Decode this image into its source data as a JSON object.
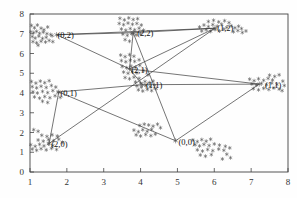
{
  "chart_data": {
    "type": "scatter",
    "title": "",
    "xlabel": "",
    "ylabel": "",
    "xlim": [
      1,
      8
    ],
    "ylim": [
      0,
      8
    ],
    "xticks": [
      1,
      2,
      3,
      4,
      5,
      6,
      7,
      8
    ],
    "yticks": [
      0,
      1,
      2,
      3,
      4,
      5,
      6,
      7,
      8
    ],
    "grid": false,
    "legend": "none",
    "marker": "asterisk",
    "marker_color": "#555555",
    "edge_color": "#3a3a3a",
    "axis_color": "#444444",
    "node_labels": [
      {
        "text": "(0,2)",
        "x": 1.72,
        "y": 6.95
      },
      {
        "text": "(2,2)",
        "x": 3.88,
        "y": 7.05
      },
      {
        "text": "(1,2)",
        "x": 6.05,
        "y": 7.32
      },
      {
        "text": "(2,1)",
        "x": 3.72,
        "y": 5.18
      },
      {
        "text": "(1,1)",
        "x": 4.12,
        "y": 4.42
      },
      {
        "text": "(0,1)",
        "x": 1.8,
        "y": 4.02
      },
      {
        "text": "(1,1)",
        "x": 7.35,
        "y": 4.42
      },
      {
        "text": "(2,0)",
        "x": 1.55,
        "y": 1.42
      },
      {
        "text": "(0,0)",
        "x": 5.0,
        "y": 1.55
      }
    ],
    "nodes": [
      {
        "id": "n02",
        "x": 1.72,
        "y": 6.95
      },
      {
        "id": "n22",
        "x": 3.8,
        "y": 7.05
      },
      {
        "id": "n12",
        "x": 6.02,
        "y": 7.28
      },
      {
        "id": "n21",
        "x": 3.7,
        "y": 5.22
      },
      {
        "id": "n11c",
        "x": 4.05,
        "y": 4.42
      },
      {
        "id": "n01",
        "x": 1.78,
        "y": 4.05
      },
      {
        "id": "n11r",
        "x": 7.22,
        "y": 4.45
      },
      {
        "id": "n20",
        "x": 1.52,
        "y": 1.45
      },
      {
        "id": "n00",
        "x": 4.95,
        "y": 1.58
      }
    ],
    "edges": [
      {
        "from": "n02",
        "to": "n22"
      },
      {
        "from": "n02",
        "to": "n12"
      },
      {
        "from": "n22",
        "to": "n12"
      },
      {
        "from": "n02",
        "to": "n21"
      },
      {
        "from": "n22",
        "to": "n21"
      },
      {
        "from": "n22",
        "to": "n00"
      },
      {
        "from": "n12",
        "to": "n21"
      },
      {
        "from": "n12",
        "to": "n20"
      },
      {
        "from": "n21",
        "to": "n11c"
      },
      {
        "from": "n21",
        "to": "n11r"
      },
      {
        "from": "n01",
        "to": "n11c"
      },
      {
        "from": "n11c",
        "to": "n11r"
      },
      {
        "from": "n01",
        "to": "n20"
      },
      {
        "from": "n01",
        "to": "n00"
      },
      {
        "from": "n00",
        "to": "n11r"
      }
    ],
    "clusters": [
      {
        "label": "(0,2)",
        "cx": 1.32,
        "cy": 6.92,
        "n": 26,
        "sx": 0.22,
        "sy": 0.34
      },
      {
        "label": "(2,2)",
        "cx": 3.72,
        "cy": 7.22,
        "n": 22,
        "sx": 0.26,
        "sy": 0.3
      },
      {
        "label": "(1,2)",
        "cx": 6.05,
        "cy": 7.28,
        "n": 26,
        "sx": 0.34,
        "sy": 0.24
      },
      {
        "label": "(2,1)",
        "cx": 3.68,
        "cy": 5.35,
        "n": 24,
        "sx": 0.26,
        "sy": 0.52
      },
      {
        "label": "(1,1)",
        "cx": 4.05,
        "cy": 4.42,
        "n": 16,
        "sx": 0.24,
        "sy": 0.22
      },
      {
        "label": "(0,1)",
        "cx": 1.52,
        "cy": 4.08,
        "n": 24,
        "sx": 0.28,
        "sy": 0.33
      },
      {
        "label": "(1,1)r",
        "cx": 7.32,
        "cy": 4.45,
        "n": 24,
        "sx": 0.3,
        "sy": 0.26
      },
      {
        "label": "(2,0)",
        "cx": 1.4,
        "cy": 1.38,
        "n": 24,
        "sx": 0.28,
        "sy": 0.26
      },
      {
        "label": "(0,0)",
        "cx": 5.85,
        "cy": 1.3,
        "n": 22,
        "sx": 0.38,
        "sy": 0.4
      },
      {
        "label": "mid",
        "cx": 4.15,
        "cy": 2.2,
        "n": 16,
        "sx": 0.3,
        "sy": 0.28
      }
    ],
    "points": [
      [
        1.04,
        7.42
      ],
      [
        1.12,
        7.3
      ],
      [
        1.2,
        7.44
      ],
      [
        1.3,
        7.28
      ],
      [
        1.38,
        7.2
      ],
      [
        1.48,
        7.34
      ],
      [
        1.02,
        7.1
      ],
      [
        1.1,
        7.06
      ],
      [
        1.18,
        7.12
      ],
      [
        1.26,
        7.02
      ],
      [
        1.36,
        7.08
      ],
      [
        1.46,
        7.0
      ],
      [
        1.06,
        6.86
      ],
      [
        1.14,
        6.78
      ],
      [
        1.24,
        6.88
      ],
      [
        1.34,
        6.76
      ],
      [
        1.44,
        6.82
      ],
      [
        1.56,
        6.96
      ],
      [
        1.08,
        6.6
      ],
      [
        1.18,
        6.54
      ],
      [
        1.3,
        6.62
      ],
      [
        1.42,
        6.58
      ],
      [
        1.52,
        6.66
      ],
      [
        1.62,
        6.6
      ],
      [
        1.22,
        6.42
      ],
      [
        1.6,
        6.9
      ],
      [
        3.44,
        7.78
      ],
      [
        3.56,
        7.7
      ],
      [
        3.68,
        7.8
      ],
      [
        3.8,
        7.72
      ],
      [
        3.92,
        7.76
      ],
      [
        3.42,
        7.52
      ],
      [
        3.54,
        7.46
      ],
      [
        3.66,
        7.54
      ],
      [
        3.78,
        7.48
      ],
      [
        3.9,
        7.52
      ],
      [
        4.02,
        7.44
      ],
      [
        3.48,
        7.24
      ],
      [
        3.6,
        7.18
      ],
      [
        3.72,
        7.26
      ],
      [
        3.84,
        7.2
      ],
      [
        3.96,
        7.28
      ],
      [
        4.08,
        7.18
      ],
      [
        3.52,
        6.98
      ],
      [
        3.64,
        6.92
      ],
      [
        3.76,
        7.0
      ],
      [
        3.88,
        6.94
      ],
      [
        4.0,
        6.98
      ],
      [
        3.58,
        6.7
      ],
      [
        3.7,
        6.62
      ],
      [
        5.6,
        7.34
      ],
      [
        5.72,
        7.44
      ],
      [
        5.84,
        7.36
      ],
      [
        5.96,
        7.46
      ],
      [
        6.08,
        7.38
      ],
      [
        6.2,
        7.48
      ],
      [
        5.66,
        7.14
      ],
      [
        5.78,
        7.2
      ],
      [
        5.9,
        7.12
      ],
      [
        6.02,
        7.22
      ],
      [
        6.14,
        7.14
      ],
      [
        6.26,
        7.24
      ],
      [
        5.84,
        7.62
      ],
      [
        5.98,
        7.68
      ],
      [
        6.12,
        7.6
      ],
      [
        6.28,
        7.66
      ],
      [
        6.4,
        7.56
      ],
      [
        6.34,
        7.32
      ],
      [
        6.46,
        7.4
      ],
      [
        6.56,
        7.3
      ],
      [
        6.66,
        7.38
      ],
      [
        6.74,
        7.26
      ],
      [
        6.52,
        7.1
      ],
      [
        6.64,
        7.16
      ],
      [
        6.76,
        7.06
      ],
      [
        6.86,
        7.14
      ],
      [
        3.46,
        5.92
      ],
      [
        3.58,
        5.84
      ],
      [
        3.7,
        5.94
      ],
      [
        3.82,
        5.86
      ],
      [
        3.48,
        5.64
      ],
      [
        3.6,
        5.58
      ],
      [
        3.72,
        5.66
      ],
      [
        3.84,
        5.6
      ],
      [
        3.96,
        5.68
      ],
      [
        3.5,
        5.34
      ],
      [
        3.62,
        5.28
      ],
      [
        3.74,
        5.36
      ],
      [
        3.86,
        5.3
      ],
      [
        3.98,
        5.4
      ],
      [
        3.54,
        5.06
      ],
      [
        3.66,
        5.0
      ],
      [
        3.78,
        5.08
      ],
      [
        3.9,
        5.02
      ],
      [
        4.08,
        5.14
      ],
      [
        3.58,
        4.78
      ],
      [
        3.7,
        4.72
      ],
      [
        3.82,
        4.8
      ],
      [
        3.96,
        4.74
      ],
      [
        4.2,
        4.92
      ],
      [
        3.86,
        4.56
      ],
      [
        4.0,
        4.5
      ],
      [
        4.12,
        4.58
      ],
      [
        4.24,
        4.52
      ],
      [
        4.34,
        4.6
      ],
      [
        3.9,
        4.36
      ],
      [
        4.02,
        4.3
      ],
      [
        4.14,
        4.38
      ],
      [
        4.26,
        4.32
      ],
      [
        4.38,
        4.4
      ],
      [
        3.94,
        4.16
      ],
      [
        4.06,
        4.1
      ],
      [
        4.18,
        4.18
      ],
      [
        4.3,
        4.12
      ],
      [
        4.42,
        4.22
      ],
      [
        1.04,
        4.58
      ],
      [
        1.16,
        4.5
      ],
      [
        1.28,
        4.6
      ],
      [
        1.4,
        4.52
      ],
      [
        1.52,
        4.62
      ],
      [
        1.06,
        4.32
      ],
      [
        1.18,
        4.26
      ],
      [
        1.3,
        4.34
      ],
      [
        1.44,
        4.28
      ],
      [
        1.58,
        4.38
      ],
      [
        1.7,
        4.3
      ],
      [
        1.08,
        4.06
      ],
      [
        1.2,
        4.0
      ],
      [
        1.34,
        4.08
      ],
      [
        1.48,
        4.02
      ],
      [
        1.62,
        4.12
      ],
      [
        1.76,
        4.04
      ],
      [
        1.12,
        3.8
      ],
      [
        1.26,
        3.74
      ],
      [
        1.4,
        3.82
      ],
      [
        1.54,
        3.76
      ],
      [
        1.68,
        3.86
      ],
      [
        1.82,
        3.78
      ],
      [
        1.34,
        3.58
      ],
      [
        1.48,
        3.52
      ],
      [
        6.96,
        4.7
      ],
      [
        7.08,
        4.62
      ],
      [
        7.2,
        4.72
      ],
      [
        7.34,
        4.64
      ],
      [
        7.46,
        4.74
      ],
      [
        7.58,
        4.66
      ],
      [
        7.02,
        4.46
      ],
      [
        7.14,
        4.4
      ],
      [
        7.28,
        4.48
      ],
      [
        7.42,
        4.42
      ],
      [
        7.56,
        4.5
      ],
      [
        7.7,
        4.44
      ],
      [
        7.06,
        4.22
      ],
      [
        7.2,
        4.16
      ],
      [
        7.34,
        4.24
      ],
      [
        7.48,
        4.18
      ],
      [
        7.62,
        4.26
      ],
      [
        7.76,
        4.2
      ],
      [
        7.5,
        4.9
      ],
      [
        7.64,
        4.84
      ],
      [
        7.76,
        4.92
      ],
      [
        7.86,
        4.6
      ],
      [
        7.9,
        4.38
      ],
      [
        7.84,
        4.12
      ],
      [
        1.02,
        1.38
      ],
      [
        1.14,
        1.3
      ],
      [
        1.26,
        1.4
      ],
      [
        1.38,
        1.32
      ],
      [
        1.5,
        1.42
      ],
      [
        1.62,
        1.34
      ],
      [
        1.06,
        1.16
      ],
      [
        1.18,
        1.1
      ],
      [
        1.3,
        1.18
      ],
      [
        1.44,
        1.12
      ],
      [
        1.58,
        1.2
      ],
      [
        1.72,
        1.14
      ],
      [
        1.22,
        1.62
      ],
      [
        1.36,
        1.56
      ],
      [
        1.5,
        1.64
      ],
      [
        1.64,
        1.58
      ],
      [
        1.78,
        1.66
      ],
      [
        1.88,
        1.5
      ],
      [
        1.32,
        1.86
      ],
      [
        1.46,
        1.8
      ],
      [
        1.6,
        1.88
      ],
      [
        1.74,
        1.82
      ],
      [
        1.1,
        2.14
      ],
      [
        1.22,
        2.06
      ],
      [
        5.42,
        1.62
      ],
      [
        5.54,
        1.54
      ],
      [
        5.66,
        1.64
      ],
      [
        5.78,
        1.56
      ],
      [
        5.9,
        1.66
      ],
      [
        5.48,
        1.38
      ],
      [
        5.6,
        1.32
      ],
      [
        5.72,
        1.4
      ],
      [
        5.86,
        1.34
      ],
      [
        6.0,
        1.42
      ],
      [
        6.14,
        1.36
      ],
      [
        5.54,
        1.12
      ],
      [
        5.68,
        1.06
      ],
      [
        5.82,
        1.14
      ],
      [
        5.96,
        1.08
      ],
      [
        6.12,
        1.16
      ],
      [
        6.26,
        1.1
      ],
      [
        5.62,
        0.86
      ],
      [
        5.76,
        0.8
      ],
      [
        5.92,
        0.88
      ],
      [
        6.3,
        1.3
      ],
      [
        6.42,
        1.22
      ],
      [
        6.34,
        0.9
      ],
      [
        6.44,
        0.72
      ],
      [
        6.22,
        0.66
      ],
      [
        3.82,
        2.12
      ],
      [
        3.94,
        2.04
      ],
      [
        4.06,
        2.14
      ],
      [
        4.18,
        2.06
      ],
      [
        4.3,
        2.16
      ],
      [
        3.88,
        1.88
      ],
      [
        4.0,
        1.82
      ],
      [
        4.14,
        1.9
      ],
      [
        4.28,
        1.84
      ],
      [
        4.4,
        1.92
      ],
      [
        4.22,
        2.38
      ],
      [
        4.34,
        2.32
      ],
      [
        4.46,
        2.42
      ],
      [
        4.54,
        2.24
      ],
      [
        4.1,
        2.42
      ],
      [
        3.98,
        2.36
      ]
    ]
  },
  "axes": {
    "x_tick_labels": [
      "1",
      "2",
      "3",
      "4",
      "5",
      "6",
      "7",
      "8"
    ],
    "y_tick_labels": [
      "0",
      "1",
      "2",
      "3",
      "4",
      "5",
      "6",
      "7",
      "8"
    ]
  }
}
